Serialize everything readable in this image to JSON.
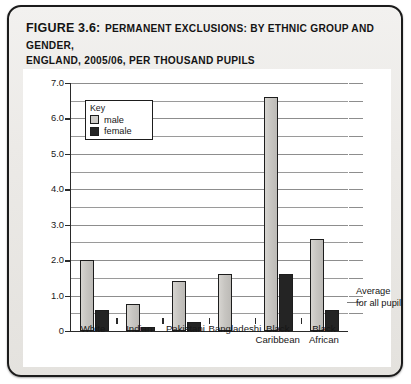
{
  "figure": {
    "number_label": "FIGURE 3.6:",
    "caption_line1": "PERMANENT EXCLUSIONS: BY ETHNIC GROUP AND GENDER,",
    "caption_line2": "ENGLAND, 2005/06, PER THOUSAND PUPILS"
  },
  "legend": {
    "title": "Key",
    "items": [
      {
        "label": "male",
        "color": "#cfcdc9"
      },
      {
        "label": "female",
        "color": "#242424"
      }
    ]
  },
  "annotation": {
    "line1": "Average",
    "line2": "for all pupils"
  },
  "chart_data": {
    "type": "bar",
    "title": "Permanent exclusions: by ethnic group and gender, England, 2005/06, per thousand pupils",
    "xlabel": "",
    "ylabel": "",
    "ylim": [
      0,
      7.0
    ],
    "ytick_labels": [
      "0",
      "1.0",
      "2.0",
      "3.0",
      "4.0",
      "5.0",
      "6.0",
      "7.0"
    ],
    "ytick_values": [
      0,
      1.0,
      2.0,
      3.0,
      4.0,
      5.0,
      6.0,
      7.0
    ],
    "minor_gridlines": [
      0.5,
      1.5,
      2.5,
      3.5,
      4.5,
      5.5,
      6.5
    ],
    "grid": true,
    "legend_position": "inside-top-left",
    "categories": [
      "White",
      "Indian",
      "Pakistani",
      "Bangladeshi",
      "Black Caribbean",
      "Black African"
    ],
    "category_lines": [
      [
        "White"
      ],
      [
        "Indian"
      ],
      [
        "Pakistani"
      ],
      [
        "Bangladeshi"
      ],
      [
        "Black",
        "Caribbean"
      ],
      [
        "Black",
        "African"
      ]
    ],
    "series": [
      {
        "name": "male",
        "color": "#cfcdc9",
        "values": [
          2.0,
          0.75,
          1.4,
          1.6,
          6.6,
          2.6
        ]
      },
      {
        "name": "female",
        "color": "#242424",
        "values": [
          0.6,
          0.1,
          0.25,
          0.0,
          1.6,
          0.6
        ]
      }
    ],
    "average_all_pupils": 1.25
  }
}
